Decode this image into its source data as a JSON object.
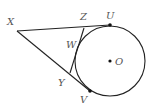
{
  "diagram": {
    "type": "geometry",
    "colors": {
      "stroke": "#222222",
      "label": "#555555",
      "background": "#ffffff"
    },
    "circle": {
      "center_label": "O",
      "cx": 110,
      "cy": 61,
      "r": 35
    },
    "points": [
      {
        "id": "X",
        "label": "X",
        "x": 17,
        "y": 31,
        "lx": 7,
        "ly": 25
      },
      {
        "id": "Z",
        "label": "Z",
        "x": 84,
        "y": 28,
        "lx": 80,
        "ly": 20
      },
      {
        "id": "U",
        "label": "U",
        "x": 110,
        "y": 25,
        "lx": 106,
        "ly": 19
      },
      {
        "id": "W",
        "label": "W",
        "x": 80,
        "y": 44,
        "lx": 66,
        "ly": 48
      },
      {
        "id": "Y",
        "label": "Y",
        "x": 70,
        "y": 73,
        "lx": 58,
        "ly": 86
      },
      {
        "id": "V",
        "label": "V",
        "x": 90,
        "y": 91,
        "lx": 80,
        "ly": 103
      },
      {
        "id": "O",
        "label": "O",
        "x": 110,
        "y": 61,
        "lx": 115,
        "ly": 65
      }
    ],
    "segments": [
      {
        "from": "X",
        "to": "U"
      },
      {
        "from": "X",
        "to": "V"
      },
      {
        "from": "Z",
        "to": "Y"
      }
    ],
    "marked_points": [
      "U",
      "V",
      "O"
    ]
  }
}
